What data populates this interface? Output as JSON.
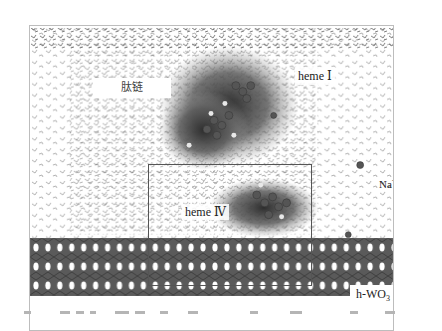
{
  "figure": {
    "labels": {
      "peptide_chain": "肽链",
      "heme_1": "heme Ⅰ",
      "heme_4": "heme Ⅳ",
      "sodium_ion": "Na",
      "sodium_charge": "+",
      "substrate_prefix": "h-WO",
      "substrate_subscript": "3"
    },
    "colors": {
      "frame_border": "#bdbdbd",
      "highlight_box": "#555555",
      "slab": "#5a5a5a",
      "water": "#6e6e6e",
      "protein_dark": "#3c3c3c"
    },
    "caption_visible": "partially cut off at bottom edge"
  }
}
